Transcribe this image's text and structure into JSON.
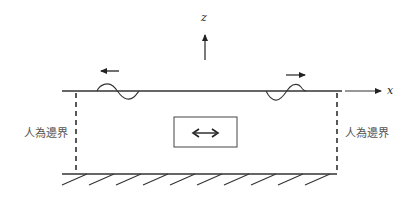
{
  "diagram": {
    "axes": {
      "x_label": "x",
      "z_label": "z"
    },
    "labels": {
      "left_boundary": "人為邊界",
      "right_boundary": "人為邊界"
    },
    "elements": {
      "free_surface": "horizontal surface line",
      "left_wave_direction": "left",
      "right_wave_direction": "right",
      "source_box_arrow": "double-headed horizontal arrow",
      "bottom": "hatched rigid bottom",
      "boundaries": "dashed artificial boundaries"
    },
    "colors": {
      "line": "#222222",
      "label": "#555555",
      "background": "#ffffff"
    }
  }
}
